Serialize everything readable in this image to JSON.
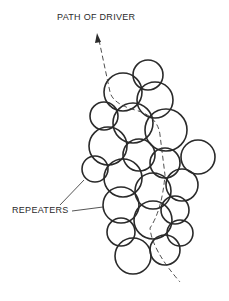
{
  "labels": {
    "path_of_driver": "PATH OF DRIVER",
    "repeaters": "REPEATERS"
  },
  "colors": {
    "stroke": "#2a2a2a",
    "background": "#ffffff"
  },
  "repeaters": [
    {
      "cx": 148,
      "cy": 75,
      "r": 15
    },
    {
      "cx": 123,
      "cy": 92,
      "r": 19
    },
    {
      "cx": 155,
      "cy": 100,
      "r": 18
    },
    {
      "cx": 104,
      "cy": 116,
      "r": 14
    },
    {
      "cx": 133,
      "cy": 123,
      "r": 20
    },
    {
      "cx": 166,
      "cy": 130,
      "r": 21
    },
    {
      "cx": 108,
      "cy": 146,
      "r": 19
    },
    {
      "cx": 139,
      "cy": 155,
      "r": 16
    },
    {
      "cx": 165,
      "cy": 163,
      "r": 15
    },
    {
      "cx": 198,
      "cy": 157,
      "r": 17
    },
    {
      "cx": 95,
      "cy": 169,
      "r": 13
    },
    {
      "cx": 123,
      "cy": 178,
      "r": 19
    },
    {
      "cx": 153,
      "cy": 191,
      "r": 18
    },
    {
      "cx": 182,
      "cy": 185,
      "r": 16
    },
    {
      "cx": 121,
      "cy": 205,
      "r": 18
    },
    {
      "cx": 153,
      "cy": 220,
      "r": 19
    },
    {
      "cx": 175,
      "cy": 210,
      "r": 14
    },
    {
      "cx": 121,
      "cy": 232,
      "r": 14
    },
    {
      "cx": 180,
      "cy": 233,
      "r": 13
    },
    {
      "cx": 133,
      "cy": 256,
      "r": 18
    },
    {
      "cx": 165,
      "cy": 250,
      "r": 15
    }
  ]
}
